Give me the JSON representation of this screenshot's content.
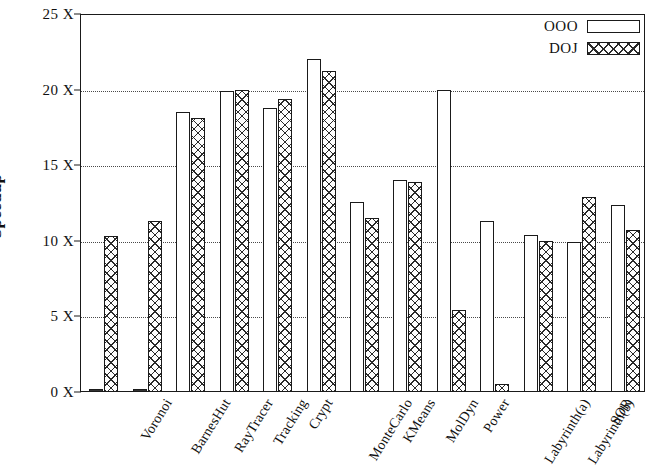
{
  "chart_data": {
    "type": "bar",
    "title": "",
    "xlabel": "",
    "ylabel": "Speedup",
    "ylim": [
      0,
      25
    ],
    "ytick_values": [
      0,
      5,
      10,
      15,
      20,
      25
    ],
    "ytick_labels": [
      "0 X",
      "5 X",
      "10 X",
      "15 X",
      "20 X",
      "25 X"
    ],
    "grid": true,
    "legend_position": "top-right",
    "categories": [
      "Voronoi",
      "BarnesHut",
      "RayTracer",
      "Tracking",
      "Crypt",
      "MonteCarlo",
      "KMeans",
      "MolDyn",
      "Power",
      "Labyrinth(a)",
      "Labyrinth(b)",
      "SOR",
      "MergeSort"
    ],
    "series": [
      {
        "name": "OOO",
        "fill": "hollow",
        "values": [
          0.1,
          0.1,
          18.5,
          19.9,
          18.8,
          22.0,
          12.6,
          14.0,
          20.0,
          11.3,
          10.4,
          9.9,
          12.4
        ]
      },
      {
        "name": "DOJ",
        "fill": "cross-hatch",
        "values": [
          10.3,
          11.3,
          18.1,
          20.0,
          19.4,
          21.2,
          11.5,
          13.9,
          5.4,
          0.5,
          10.0,
          12.9,
          10.7
        ]
      }
    ]
  },
  "legend": {
    "entries": [
      {
        "label": "OOO"
      },
      {
        "label": "DOJ"
      }
    ]
  },
  "colors": {
    "axis": "#1a1a1a",
    "grid": "#4a4a4a",
    "bar_outline": "#1a1a1a",
    "hatch": "#2a2a2a",
    "background": "#ffffff"
  }
}
